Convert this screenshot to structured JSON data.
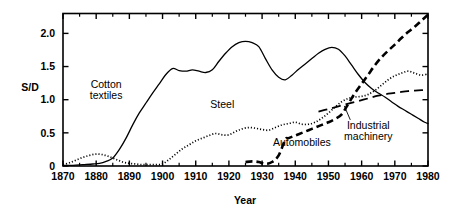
{
  "chart_data": {
    "type": "line",
    "title": "",
    "subtitle": "",
    "xlabel": "Year",
    "ylabel": "S/D",
    "xlim": [
      1870,
      1980
    ],
    "ylim": [
      0,
      2.3
    ],
    "grid": false,
    "legend_position": "inline-annotations",
    "xticks": [
      1870,
      1880,
      1890,
      1900,
      1910,
      1920,
      1930,
      1940,
      1950,
      1960,
      1970,
      1980
    ],
    "xtick_labels": [
      "1870",
      "1880",
      "1890",
      "1900",
      "1910",
      "1920",
      "1930",
      "1940",
      "1950",
      "1960",
      "1970",
      "1980"
    ],
    "xminor_step": 5,
    "yticks": [
      0,
      0.5,
      1.0,
      1.5,
      2.0
    ],
    "ytick_labels": [
      "0",
      "0.5",
      "1.0",
      "1.5",
      "2.0"
    ],
    "series": [
      {
        "name": "Cotton textiles",
        "style": "solid",
        "x": [
          1870,
          1873,
          1876,
          1879,
          1881,
          1883,
          1885,
          1887,
          1889,
          1891,
          1893,
          1895,
          1897,
          1899,
          1901,
          1903,
          1905,
          1907,
          1909,
          1911,
          1913,
          1915,
          1917,
          1919,
          1921,
          1923,
          1925,
          1927,
          1929,
          1931,
          1933,
          1935,
          1937,
          1939,
          1941,
          1943,
          1945,
          1947,
          1949,
          1951,
          1953,
          1955,
          1957,
          1959,
          1961,
          1963,
          1965,
          1967,
          1969,
          1971,
          1973,
          1975,
          1977,
          1979,
          1980
        ],
        "y": [
          0.01,
          0.01,
          0.02,
          0.03,
          0.04,
          0.07,
          0.12,
          0.25,
          0.42,
          0.62,
          0.8,
          0.95,
          1.1,
          1.24,
          1.38,
          1.47,
          1.44,
          1.43,
          1.45,
          1.43,
          1.41,
          1.45,
          1.58,
          1.7,
          1.8,
          1.86,
          1.88,
          1.86,
          1.8,
          1.62,
          1.45,
          1.34,
          1.3,
          1.37,
          1.46,
          1.54,
          1.62,
          1.7,
          1.76,
          1.79,
          1.76,
          1.66,
          1.52,
          1.38,
          1.26,
          1.17,
          1.1,
          1.04,
          0.97,
          0.9,
          0.84,
          0.78,
          0.72,
          0.66,
          0.64
        ]
      },
      {
        "name": "Steel",
        "style": "dotted",
        "x": [
          1870,
          1872,
          1874,
          1876,
          1878,
          1880,
          1882,
          1884,
          1886,
          1888,
          1890,
          1892,
          1894,
          1896,
          1898,
          1900,
          1902,
          1904,
          1906,
          1908,
          1910,
          1912,
          1914,
          1916,
          1918,
          1920,
          1922,
          1924,
          1926,
          1928,
          1930,
          1932,
          1934,
          1936,
          1938,
          1940,
          1942,
          1944,
          1946,
          1948,
          1950,
          1952,
          1954,
          1956,
          1958,
          1960,
          1962,
          1964,
          1966,
          1968,
          1970,
          1972,
          1974,
          1976,
          1978,
          1980
        ],
        "y": [
          0.02,
          0.05,
          0.09,
          0.13,
          0.16,
          0.18,
          0.17,
          0.14,
          0.1,
          0.06,
          0.04,
          0.03,
          0.02,
          0.02,
          0.02,
          0.03,
          0.1,
          0.18,
          0.26,
          0.32,
          0.38,
          0.42,
          0.46,
          0.49,
          0.47,
          0.47,
          0.52,
          0.56,
          0.58,
          0.57,
          0.55,
          0.54,
          0.58,
          0.62,
          0.64,
          0.66,
          0.63,
          0.63,
          0.66,
          0.72,
          0.8,
          0.89,
          0.97,
          1.02,
          1.04,
          1.05,
          1.08,
          1.14,
          1.22,
          1.3,
          1.36,
          1.4,
          1.43,
          1.4,
          1.37,
          1.39
        ]
      },
      {
        "name": "Automobiles",
        "style": "dashed",
        "x": [
          1925,
          1927,
          1929,
          1931,
          1933,
          1935,
          1937,
          1938,
          1940,
          1942,
          1944,
          1946,
          1948,
          1950,
          1952,
          1954,
          1956,
          1958,
          1960,
          1962,
          1964,
          1966,
          1968,
          1970,
          1972,
          1974,
          1976,
          1978,
          1980
        ],
        "y": [
          0.06,
          0.07,
          0.06,
          0.03,
          0.06,
          0.16,
          0.4,
          0.42,
          0.46,
          0.5,
          0.54,
          0.58,
          0.62,
          0.66,
          0.71,
          0.78,
          0.94,
          1.1,
          1.24,
          1.38,
          1.52,
          1.64,
          1.74,
          1.83,
          1.93,
          2.02,
          2.1,
          2.19,
          2.28
        ]
      },
      {
        "name": "Industrial machinery",
        "style": "long-dashed",
        "x": [
          1947,
          1950,
          1953,
          1956,
          1959,
          1962,
          1965,
          1968,
          1971,
          1974,
          1977,
          1980
        ],
        "y": [
          0.82,
          0.86,
          0.9,
          0.94,
          0.98,
          1.02,
          1.06,
          1.09,
          1.11,
          1.13,
          1.14,
          1.15
        ]
      }
    ],
    "annotations": [
      {
        "text_line1": "Cotton",
        "text_line2": "textiles",
        "x": 1883,
        "y": 1.18,
        "leader": false
      },
      {
        "text_line1": "Steel",
        "text_line2": "",
        "x": 1918,
        "y": 0.87,
        "leader": false
      },
      {
        "text_line1": "Automobiles",
        "text_line2": "",
        "x": 1942,
        "y": 0.3,
        "leader": false
      },
      {
        "text_line1": "Industrial",
        "text_line2": "machinery",
        "x": 1962,
        "y": 0.56,
        "leader": true
      }
    ]
  },
  "axis": {
    "ylabel": "S/D",
    "xlabel": "Year"
  }
}
